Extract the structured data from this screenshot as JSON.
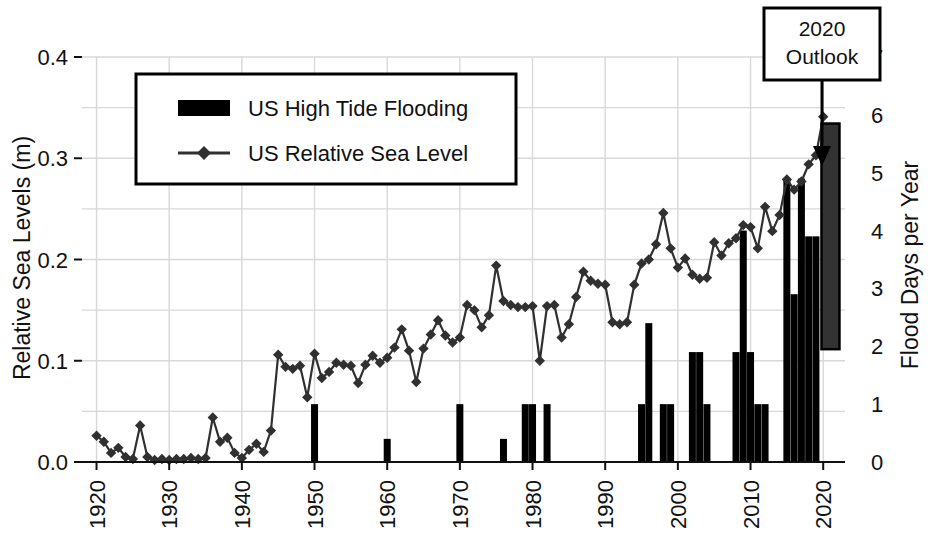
{
  "chart_data": {
    "type": "bar",
    "title": "",
    "xlabel": "",
    "ylabel": "Relative Sea Levels (m)",
    "y2label": "Flood Days per Year",
    "xlim": [
      1918,
      2023
    ],
    "ylim": [
      0.0,
      0.4
    ],
    "y2lim": [
      0,
      7
    ],
    "grid": true,
    "legend_position": "upper-left",
    "x_ticks": [
      "1920",
      "1930",
      "1940",
      "1950",
      "1960",
      "1970",
      "1980",
      "1990",
      "2000",
      "2010",
      "2020"
    ],
    "y_ticks": [
      "0.0",
      "0.1",
      "0.2",
      "0.3",
      "0.4"
    ],
    "y2_ticks": [
      "0",
      "1",
      "2",
      "3",
      "4",
      "5",
      "6",
      "7"
    ],
    "series": [
      {
        "name": "US High Tide Flooding",
        "kind": "bar",
        "axis": "right",
        "color": "#000000",
        "x": [
          1920,
          1921,
          1922,
          1923,
          1924,
          1925,
          1926,
          1927,
          1928,
          1929,
          1930,
          1931,
          1932,
          1933,
          1934,
          1935,
          1936,
          1937,
          1938,
          1939,
          1940,
          1941,
          1942,
          1943,
          1944,
          1945,
          1946,
          1947,
          1948,
          1949,
          1950,
          1951,
          1952,
          1953,
          1954,
          1955,
          1956,
          1957,
          1958,
          1959,
          1960,
          1961,
          1962,
          1963,
          1964,
          1965,
          1966,
          1967,
          1968,
          1969,
          1970,
          1971,
          1972,
          1973,
          1974,
          1975,
          1976,
          1977,
          1978,
          1979,
          1980,
          1981,
          1982,
          1983,
          1984,
          1985,
          1986,
          1987,
          1988,
          1989,
          1990,
          1991,
          1992,
          1993,
          1994,
          1995,
          1996,
          1997,
          1998,
          1999,
          2000,
          2001,
          2002,
          2003,
          2004,
          2005,
          2006,
          2007,
          2008,
          2009,
          2010,
          2011,
          2012,
          2013,
          2014,
          2015,
          2016,
          2017,
          2018,
          2019
        ],
        "values": [
          0,
          0,
          0,
          0,
          0,
          0,
          0,
          0,
          0,
          0,
          0,
          0,
          0,
          0,
          0,
          0,
          0,
          0,
          0,
          0,
          0,
          0,
          0,
          0,
          0,
          0,
          0,
          0,
          0,
          0,
          1.0,
          0,
          0,
          0,
          0,
          0,
          0,
          0,
          0,
          0,
          0.4,
          0,
          0,
          0,
          0,
          0,
          0,
          0,
          0,
          0,
          1.0,
          0,
          0,
          0,
          0,
          0,
          0.4,
          0,
          0,
          1.0,
          1.0,
          0,
          1.0,
          0,
          0,
          0,
          0,
          0,
          0,
          0,
          0,
          0,
          0,
          0,
          0,
          1.0,
          2.4,
          0,
          1.0,
          1.0,
          0,
          0,
          1.9,
          1.9,
          1.0,
          0,
          0,
          0,
          1.9,
          4.0,
          1.9,
          1.0,
          1.0,
          0,
          0,
          4.9,
          2.9,
          4.9,
          3.9,
          3.9
        ]
      },
      {
        "name": "US Relative Sea Level",
        "kind": "line",
        "axis": "left",
        "color": "#303030",
        "marker": "diamond",
        "x": [
          1920,
          1921,
          1922,
          1923,
          1924,
          1925,
          1926,
          1927,
          1928,
          1929,
          1930,
          1931,
          1932,
          1933,
          1934,
          1935,
          1936,
          1937,
          1938,
          1939,
          1940,
          1941,
          1942,
          1943,
          1944,
          1945,
          1946,
          1947,
          1948,
          1949,
          1950,
          1951,
          1952,
          1953,
          1954,
          1955,
          1956,
          1957,
          1958,
          1959,
          1960,
          1961,
          1962,
          1963,
          1964,
          1965,
          1966,
          1967,
          1968,
          1969,
          1970,
          1971,
          1972,
          1973,
          1974,
          1975,
          1976,
          1977,
          1978,
          1979,
          1980,
          1981,
          1982,
          1983,
          1984,
          1985,
          1986,
          1987,
          1988,
          1989,
          1990,
          1991,
          1992,
          1993,
          1994,
          1995,
          1996,
          1997,
          1998,
          1999,
          2000,
          2001,
          2002,
          2003,
          2004,
          2005,
          2006,
          2007,
          2008,
          2009,
          2010,
          2011,
          2012,
          2013,
          2014,
          2015,
          2016,
          2017,
          2018,
          2019,
          2020
        ],
        "values": [
          0.026,
          0.02,
          0.009,
          0.014,
          0.005,
          0.003,
          0.036,
          0.005,
          0.002,
          0.003,
          0.002,
          0.003,
          0.003,
          0.004,
          0.003,
          0.004,
          0.044,
          0.02,
          0.024,
          0.009,
          0.004,
          0.012,
          0.018,
          0.01,
          0.031,
          0.106,
          0.094,
          0.092,
          0.095,
          0.064,
          0.107,
          0.083,
          0.089,
          0.098,
          0.096,
          0.095,
          0.078,
          0.096,
          0.105,
          0.098,
          0.103,
          0.113,
          0.131,
          0.11,
          0.079,
          0.112,
          0.126,
          0.14,
          0.125,
          0.118,
          0.123,
          0.155,
          0.15,
          0.133,
          0.145,
          0.194,
          0.159,
          0.155,
          0.153,
          0.153,
          0.154,
          0.1,
          0.154,
          0.155,
          0.123,
          0.136,
          0.163,
          0.188,
          0.179,
          0.176,
          0.175,
          0.138,
          0.136,
          0.138,
          0.175,
          0.196,
          0.2,
          0.215,
          0.246,
          0.211,
          0.192,
          0.201,
          0.185,
          0.181,
          0.182,
          0.217,
          0.204,
          0.216,
          0.221,
          0.234,
          0.232,
          0.211,
          0.252,
          0.228,
          0.244,
          0.279,
          0.269,
          0.277,
          0.294,
          0.303,
          0.341
        ]
      }
    ],
    "outlook": {
      "label_line1": "2020",
      "label_line2": "Outlook",
      "year": 2021,
      "low": 1.95,
      "high": 5.85,
      "color": "#333333",
      "edge_color": "#000000"
    },
    "legend_entries": [
      {
        "label": "US High Tide Flooding",
        "marker": "bar",
        "color": "#000000"
      },
      {
        "label": "US Relative Sea Level",
        "marker": "line-diamond",
        "color": "#303030"
      }
    ]
  }
}
